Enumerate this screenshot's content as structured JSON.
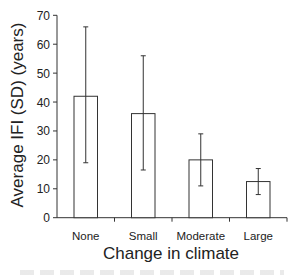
{
  "chart_data": {
    "type": "bar",
    "title": "",
    "xlabel": "Change in climate",
    "ylabel": "Average IFI (SD) (years)",
    "categories": [
      "None",
      "Small",
      "Moderate",
      "Large"
    ],
    "values": [
      42,
      36,
      20,
      12.5
    ],
    "error_upper": [
      66,
      56,
      29,
      17
    ],
    "error_lower": [
      19,
      16.5,
      11,
      8
    ],
    "ylim": [
      0,
      70
    ],
    "yticks": [
      0,
      10,
      20,
      30,
      40,
      50,
      60,
      70
    ],
    "grid": false,
    "legend": null,
    "bar_fill": "#ffffff",
    "bar_stroke": "#333333"
  }
}
